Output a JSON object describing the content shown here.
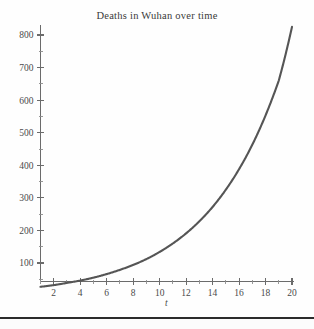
{
  "figure": {
    "title": "Deaths in Wuhan over time",
    "background_color": "#fefefe",
    "curve_color": "#555555",
    "axis_color": "#6b6b6b",
    "rule_color": "#2b2b2b",
    "x_axis_label": "t",
    "y_axis_label": ""
  },
  "chart_data": {
    "type": "line",
    "title": "Deaths in Wuhan over time",
    "xlabel": "t",
    "ylabel": "",
    "xlim": [
      1,
      20
    ],
    "ylim": [
      0,
      840
    ],
    "grid": false,
    "legend": null,
    "x_ticks": [
      2,
      4,
      6,
      8,
      10,
      12,
      14,
      16,
      18,
      20
    ],
    "x_tick_labels": [
      "2",
      "4",
      "6",
      "8",
      "10",
      "12",
      "14",
      "16",
      "18",
      "20"
    ],
    "x_minor_ticks": [
      1,
      3,
      5,
      7,
      9,
      11,
      13,
      15,
      17,
      19
    ],
    "y_ticks": [
      100,
      200,
      300,
      400,
      500,
      600,
      700,
      800
    ],
    "y_tick_labels": [
      "100",
      "200",
      "300",
      "400",
      "500",
      "600",
      "700",
      "800"
    ],
    "y_minor_ticks": [
      50,
      150,
      250,
      350,
      450,
      550,
      650,
      750
    ],
    "series": [
      {
        "name": "Deaths",
        "color": "#555555",
        "x": [
          1,
          2,
          3,
          4,
          5,
          6,
          7,
          8,
          9,
          10,
          11,
          12,
          13,
          14,
          15,
          16,
          17,
          18,
          19,
          20
        ],
        "values": [
          27,
          32,
          39,
          46,
          55,
          66,
          79,
          94,
          112,
          134,
          160,
          191,
          228,
          272,
          325,
          388,
          463,
          553,
          660,
          825
        ]
      }
    ]
  }
}
